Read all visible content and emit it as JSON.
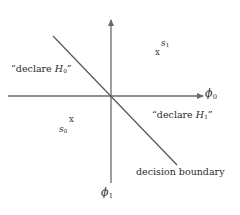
{
  "figure": {
    "type": "signal-space-decision-diagram",
    "width": 240,
    "height": 215,
    "background_color": "#ffffff",
    "line_color": "#6a6a6a",
    "text_color": "#2b2b2b"
  },
  "axes": {
    "origin": {
      "x": 111,
      "y": 96
    },
    "horizontal": {
      "label": "ϕ0",
      "label_text": "ϕ",
      "label_sub": "0",
      "from_x": 8,
      "to_x": 205,
      "y": 96,
      "arrow": "right"
    },
    "vertical": {
      "label": "ϕ1",
      "label_text": "ϕ",
      "label_sub": "1",
      "x": 111,
      "from_y": 183,
      "to_y": 18,
      "arrow": "up"
    }
  },
  "boundary": {
    "caption": "decision boundary",
    "x1": 53,
    "y1": 36,
    "x2": 177,
    "y2": 165,
    "slope_sign": "negative"
  },
  "regions": [
    {
      "name": "declare-h0",
      "label": "“declare H0”",
      "prefix": "“declare ",
      "symbol": "H",
      "sub": "0",
      "suffix": "”"
    },
    {
      "name": "declare-h1",
      "label": "“declare H1”",
      "prefix": "“declare ",
      "symbol": "H",
      "sub": "1",
      "suffix": "”"
    }
  ],
  "signals": [
    {
      "name": "s1",
      "symbol": "s",
      "sub": "1",
      "mark": "x",
      "x": 158,
      "y": 53
    },
    {
      "name": "s0",
      "symbol": "s",
      "sub": "0",
      "mark": "x",
      "x": 72,
      "y": 122
    }
  ],
  "marks": {
    "sample_glyph": "x"
  }
}
